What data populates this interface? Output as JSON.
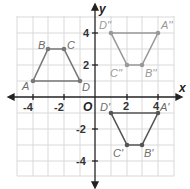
{
  "diagram": {
    "type": "coordinate-plane",
    "axes": {
      "x_label": "x",
      "y_label": "y",
      "origin_label": "O",
      "range": [
        -5,
        5
      ]
    },
    "x_ticks": [
      "-4",
      "-2",
      "2",
      "4"
    ],
    "y_ticks": [
      "4",
      "2",
      "-2",
      "-4"
    ],
    "colors": {
      "grid": "#d9d9d9",
      "axis": "#222222",
      "shape_gray": "#777777",
      "shape_dark": "#555555"
    },
    "shapes": [
      {
        "name": "ABCD",
        "vertices": [
          {
            "label": "A",
            "x": -4,
            "y": 1
          },
          {
            "label": "B",
            "x": -3,
            "y": 3
          },
          {
            "label": "C",
            "x": -2,
            "y": 3
          },
          {
            "label": "D",
            "x": 0,
            "y": 1
          }
        ]
      },
      {
        "name": "A'B'C'D'",
        "vertices": [
          {
            "label": "A'",
            "x": 4,
            "y": -1
          },
          {
            "label": "B'",
            "x": 3,
            "y": -3
          },
          {
            "label": "C'",
            "x": 2,
            "y": -3
          },
          {
            "label": "D'",
            "x": 1,
            "y": -1
          }
        ]
      },
      {
        "name": "A''B''C''D''",
        "vertices": [
          {
            "label": "A''",
            "x": 4,
            "y": 4
          },
          {
            "label": "B''",
            "x": 3,
            "y": 2
          },
          {
            "label": "C''",
            "x": 2,
            "y": 2
          },
          {
            "label": "D''",
            "x": 1,
            "y": 4
          }
        ]
      }
    ]
  }
}
